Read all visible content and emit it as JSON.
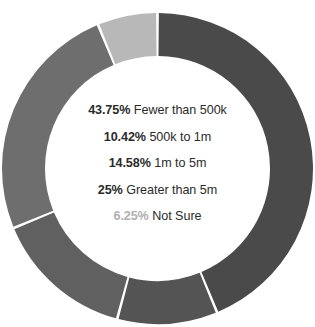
{
  "chart_data": {
    "type": "pie",
    "variant": "donut",
    "title": "",
    "subtitle": "",
    "xlabel": "",
    "ylabel": "",
    "legend_position": "center",
    "grid": false,
    "start_angle_deg": 0,
    "direction": "clockwise",
    "categories": [
      "Fewer than 500k",
      "500k to 1m",
      "1m to 5m",
      "Greater than 5m",
      "Not Sure"
    ],
    "values": [
      43.75,
      10.42,
      14.58,
      25,
      6.25
    ],
    "value_unit": "%",
    "slices": [
      {
        "label": "Fewer than 500k",
        "percent_text": "43.75%",
        "value": 43.75,
        "color": "#4a4a4a",
        "start_deg": 0,
        "end_deg": 157.5
      },
      {
        "label": "500k to 1m",
        "percent_text": "10.42%",
        "value": 10.42,
        "color": "#545454",
        "start_deg": 157.5,
        "end_deg": 195
      },
      {
        "label": "1m to 5m",
        "percent_text": "14.58%",
        "value": 14.58,
        "color": "#606060",
        "start_deg": 195,
        "end_deg": 247.5
      },
      {
        "label": "Greater than 5m",
        "percent_text": "25%",
        "value": 25,
        "color": "#6e6e6e",
        "start_deg": 247.5,
        "end_deg": 337.5
      },
      {
        "label": "Not Sure",
        "percent_text": "6.25%",
        "value": 6.25,
        "color": "#b8b8b8",
        "start_deg": 337.5,
        "end_deg": 360
      }
    ],
    "center_labels": [
      {
        "percent": "43.75%",
        "label": "Fewer than 500k",
        "muted": false
      },
      {
        "percent": "10.42%",
        "label": "500k to 1m",
        "muted": false
      },
      {
        "percent": "14.58%",
        "label": "1m to 5m",
        "muted": false
      },
      {
        "percent": "25%",
        "label": "Greater than 5m",
        "muted": false
      },
      {
        "percent": "6.25%",
        "label": "Not Sure",
        "muted": true
      }
    ]
  },
  "style": {
    "background": "#ffffff",
    "text_color": "#2b2b2b",
    "muted_text_color": "#b0b0b0",
    "separator_color": "#ffffff"
  }
}
